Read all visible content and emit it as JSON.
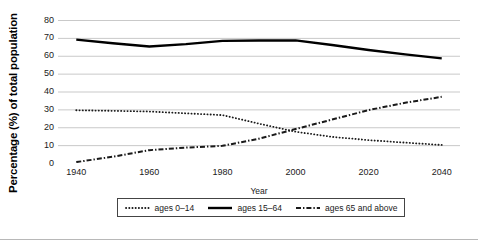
{
  "chart_data": {
    "type": "line",
    "title": "",
    "xlabel": "Year",
    "ylabel": "Percentage (%) of total population",
    "xlim": [
      1935,
      2045
    ],
    "ylim": [
      0,
      80
    ],
    "ytick_labels": [
      "0",
      "10",
      "20",
      "30",
      "40",
      "50",
      "60",
      "70",
      "80"
    ],
    "ytick_values": [
      0,
      10,
      20,
      30,
      40,
      50,
      60,
      70,
      80
    ],
    "xtick_labels": [
      "1940",
      "1960",
      "1980",
      "2000",
      "2020",
      "2040"
    ],
    "xtick_values": [
      1940,
      1960,
      1980,
      2000,
      2020,
      2040
    ],
    "grid": "horizontal",
    "legend_position": "below",
    "x": [
      1940,
      1950,
      1960,
      1970,
      1980,
      1990,
      2000,
      2010,
      2020,
      2030,
      2040
    ],
    "series": [
      {
        "name": "ages 0-14",
        "label": "ages 0–14",
        "style": "dotted",
        "color": "#1a1a1a",
        "values": [
          29.5,
          29.2,
          28.8,
          27.8,
          26.8,
          22.0,
          17.5,
          14.6,
          12.8,
          11.4,
          10.1
        ]
      },
      {
        "name": "ages 15-64",
        "label": "ages 15–64",
        "style": "solid",
        "color": "#000000",
        "values": [
          69.0,
          67.0,
          65.2,
          66.5,
          68.3,
          68.5,
          68.6,
          66.0,
          63.2,
          60.8,
          58.5
        ]
      },
      {
        "name": "ages 65 and above",
        "label": "ages 65 and above",
        "style": "dash-dot",
        "color": "#1a1a1a",
        "values": [
          0.5,
          3.5,
          7.2,
          8.6,
          9.6,
          13.6,
          19.0,
          24.3,
          29.6,
          33.7,
          37.0
        ]
      }
    ]
  },
  "axis": {
    "y_title": "Percentage (%) of total population",
    "x_title": "Year"
  },
  "legend": {
    "items": [
      {
        "label": "ages 0–14",
        "marker": "dotted-line-icon"
      },
      {
        "label": "ages 15–64",
        "marker": "solid-line-icon"
      },
      {
        "label": "ages 65 and above",
        "marker": "dash-dot-line-icon"
      }
    ]
  }
}
